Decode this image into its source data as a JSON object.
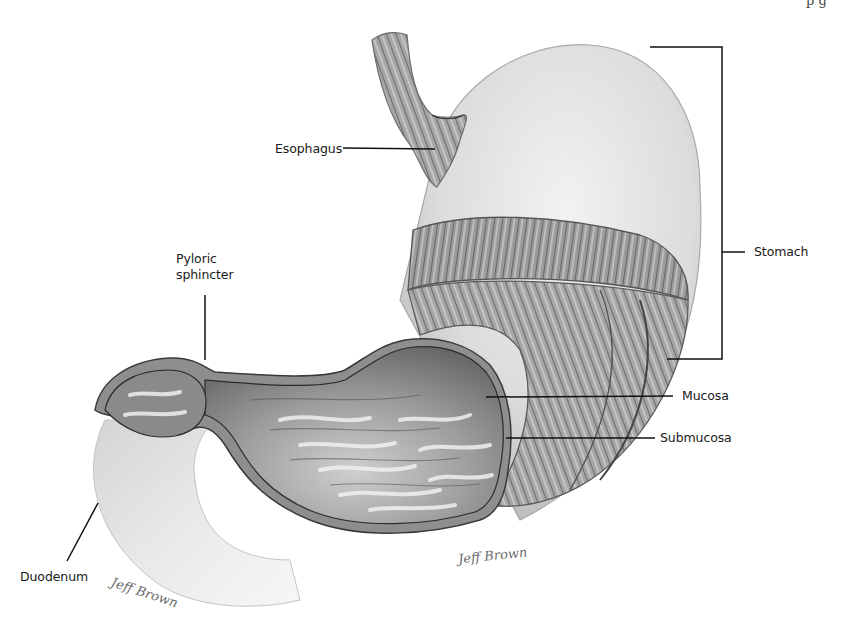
{
  "figure": {
    "top_right_text": "p g",
    "labels": {
      "esophagus": "Esophagus",
      "stomach": "Stomach",
      "pyloric_sphincter_line1": "Pyloric",
      "pyloric_sphincter_line2": "sphincter",
      "mucosa": "Mucosa",
      "submucosa": "Submucosa",
      "duodenum": "Duodenum"
    },
    "signatures": {
      "main": "Jeff Brown",
      "corner": "Jeff Brown"
    },
    "colors": {
      "background": "#ffffff",
      "label_text": "#1a1a1a",
      "leader_line": "#111111",
      "serosa_light": "#e6e6e6",
      "muscle_mid": "#9a9a9a",
      "mucosa_dark": "#6e6e6e",
      "rugae_light": "#d8d8d8"
    }
  }
}
